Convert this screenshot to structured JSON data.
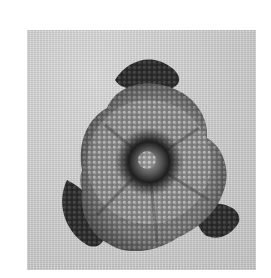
{
  "image": {
    "subject": "beaded flower on linen fabric",
    "palette": {
      "background": "#ffffff",
      "fabric": "#d2d2d2",
      "petal_outer": "#5a5a5a",
      "petal_light": "#9a9a9a",
      "bead_highlight": "#e6e6e6",
      "sepal_dark": "#2e2e2e",
      "center_dark": "#1e1e1e",
      "center_light": "#8a8a8a"
    }
  }
}
